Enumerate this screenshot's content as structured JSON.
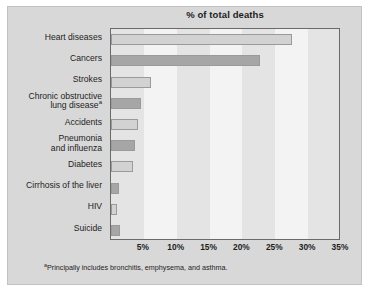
{
  "chart_data": {
    "type": "bar",
    "orientation": "horizontal",
    "title": "% of total deaths",
    "xlabel": "",
    "ylabel": "",
    "xlim": [
      0,
      35
    ],
    "grid": false,
    "alternating_bands": true,
    "legend": null,
    "categories": [
      "Heart diseases",
      "Cancers",
      "Strokes",
      "Chronic obstructive lung disease",
      "Accidents",
      "Pneumonia and influenza",
      "Diabetes",
      "Cirrhosis of the liver",
      "HIV",
      "Suicide"
    ],
    "values": [
      27.6,
      22.7,
      6.1,
      4.5,
      4.1,
      3.7,
      3.4,
      1.2,
      0.9,
      1.3
    ],
    "tick_labels": [
      "5%",
      "10%",
      "15%",
      "20%",
      "25%",
      "30%",
      "35%"
    ],
    "tick_values": [
      5,
      10,
      15,
      20,
      25,
      30,
      35
    ],
    "footnote": "Principally includes bronchitis, emphysema, and asthma.",
    "footnote_marker": "a",
    "colors": {
      "bar_light": "#d2d2d2",
      "bar_dark": "#a6a6a6",
      "band": "#e4e4e4",
      "plot_background": "#f3f3f3",
      "panel_background": "#d8d8d8",
      "axis": "#6a6a6a",
      "text": "#1d1d1d"
    }
  },
  "labels": {
    "rows": [
      {
        "line1": "Heart diseases",
        "line2": "",
        "sup": ""
      },
      {
        "line1": "Cancers",
        "line2": "",
        "sup": ""
      },
      {
        "line1": "Strokes",
        "line2": "",
        "sup": ""
      },
      {
        "line1": "Chronic obstructive",
        "line2": "lung disease",
        "sup": "a"
      },
      {
        "line1": "Accidents",
        "line2": "",
        "sup": ""
      },
      {
        "line1": "Pneumonia",
        "line2": "and influenza",
        "sup": ""
      },
      {
        "line1": "Diabetes",
        "line2": "",
        "sup": ""
      },
      {
        "line1": "Cirrhosis of the liver",
        "line2": "",
        "sup": ""
      },
      {
        "line1": "HIV",
        "line2": "",
        "sup": ""
      },
      {
        "line1": "Suicide",
        "line2": "",
        "sup": ""
      }
    ]
  }
}
